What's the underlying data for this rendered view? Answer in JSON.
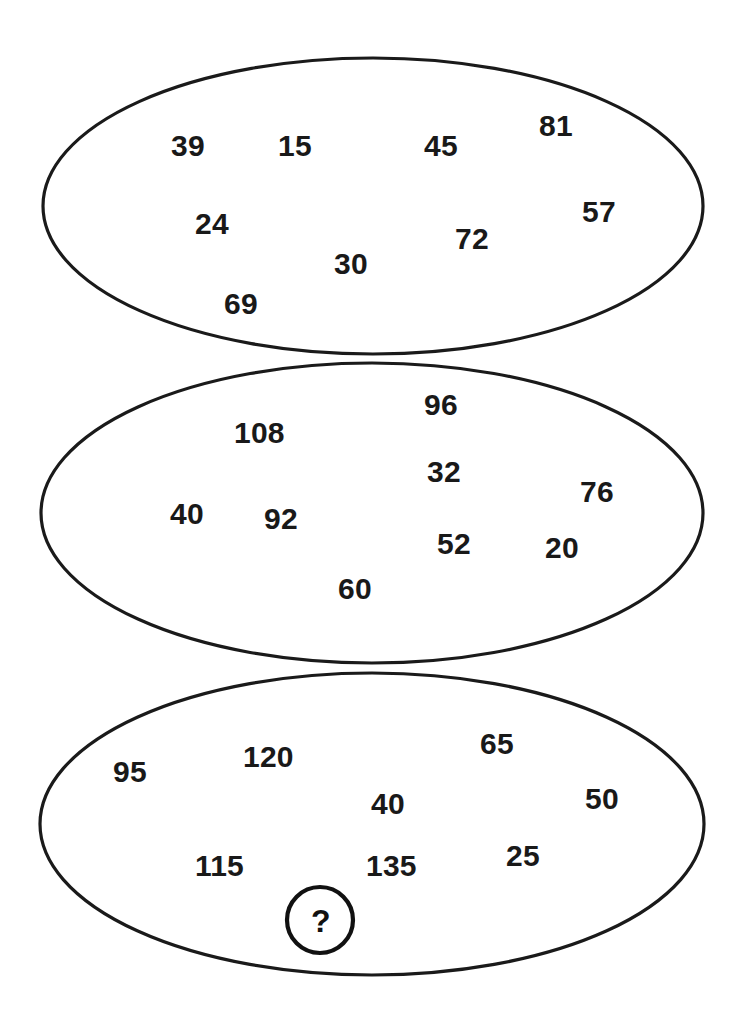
{
  "figure": {
    "type": "number-grouping-puzzle",
    "background_color": "#ffffff",
    "outline_color": "#1a1a1a",
    "number_color": "#191919",
    "shape": "ellipse",
    "group_count": 3
  },
  "groups": [
    {
      "id": "group-1",
      "name": "top-ellipse",
      "geometry": {
        "cx": 373,
        "cy": 206,
        "rx": 330,
        "ry": 148
      },
      "numbers": [
        {
          "value": "39",
          "x": 171,
          "y": 131
        },
        {
          "value": "15",
          "x": 278,
          "y": 131
        },
        {
          "value": "45",
          "x": 424,
          "y": 131
        },
        {
          "value": "81",
          "x": 539,
          "y": 111
        },
        {
          "value": "24",
          "x": 195,
          "y": 209
        },
        {
          "value": "57",
          "x": 582,
          "y": 197
        },
        {
          "value": "72",
          "x": 455,
          "y": 224
        },
        {
          "value": "30",
          "x": 334,
          "y": 249
        },
        {
          "value": "69",
          "x": 224,
          "y": 289
        }
      ]
    },
    {
      "id": "group-2",
      "name": "middle-ellipse",
      "geometry": {
        "cx": 372,
        "cy": 513,
        "rx": 331,
        "ry": 150
      },
      "numbers": [
        {
          "value": "96",
          "x": 424,
          "y": 390
        },
        {
          "value": "108",
          "x": 234,
          "y": 418
        },
        {
          "value": "32",
          "x": 427,
          "y": 457
        },
        {
          "value": "76",
          "x": 580,
          "y": 477
        },
        {
          "value": "40",
          "x": 170,
          "y": 499
        },
        {
          "value": "92",
          "x": 264,
          "y": 504
        },
        {
          "value": "52",
          "x": 437,
          "y": 529
        },
        {
          "value": "20",
          "x": 545,
          "y": 533
        },
        {
          "value": "60",
          "x": 338,
          "y": 574
        }
      ]
    },
    {
      "id": "group-3",
      "name": "bottom-ellipse",
      "geometry": {
        "cx": 372,
        "cy": 824,
        "rx": 332,
        "ry": 151
      },
      "numbers": [
        {
          "value": "95",
          "x": 113,
          "y": 757
        },
        {
          "value": "120",
          "x": 243,
          "y": 742
        },
        {
          "value": "65",
          "x": 480,
          "y": 729
        },
        {
          "value": "40",
          "x": 371,
          "y": 789
        },
        {
          "value": "50",
          "x": 585,
          "y": 784
        },
        {
          "value": "115",
          "x": 195,
          "y": 851
        },
        {
          "value": "135",
          "x": 366,
          "y": 851
        },
        {
          "value": "25",
          "x": 506,
          "y": 841
        }
      ],
      "answer_slot": {
        "label": "?",
        "cx": 320,
        "cy": 920,
        "r": 33
      }
    }
  ]
}
